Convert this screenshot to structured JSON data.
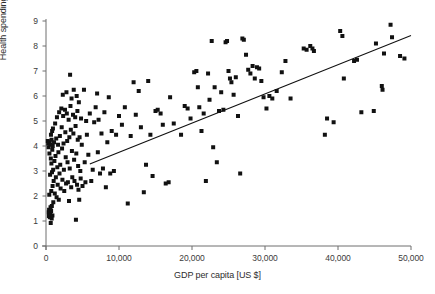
{
  "chart_data": {
    "type": "scatter",
    "title": "",
    "xlabel": "GDP per capita [US $]",
    "ylabel": "Health spending [% GDP]",
    "xlim": [
      0,
      50000
    ],
    "ylim": [
      0,
      9
    ],
    "grid": false,
    "legend": null,
    "xticks": [
      0,
      10000,
      20000,
      30000,
      40000,
      50000
    ],
    "xticklabels": [
      "0",
      "10,000",
      "20,000",
      "30,000",
      "40,000",
      "50,000"
    ],
    "yticks": [
      0,
      1,
      2,
      3,
      4,
      5,
      6,
      7,
      8,
      9
    ],
    "yticklabels": [
      "0",
      "1",
      "2",
      "3",
      "4",
      "5",
      "6",
      "7",
      "8",
      "9"
    ],
    "marker": "square",
    "marker_color": "#111111",
    "marker_size_px": 4,
    "spines": [
      "left",
      "bottom"
    ],
    "trendline": {
      "type": "linear",
      "color": "#111111",
      "x_start": 6000,
      "y_start": 3.28,
      "x_end": 50000,
      "y_end": 8.42
    },
    "points": [
      [
        250,
        4.2
      ],
      [
        300,
        4.1
      ],
      [
        350,
        3.95
      ],
      [
        380,
        1.35
      ],
      [
        400,
        1.2
      ],
      [
        420,
        1.45
      ],
      [
        450,
        2.05
      ],
      [
        470,
        3.7
      ],
      [
        500,
        4.15
      ],
      [
        520,
        1.15
      ],
      [
        540,
        1.3
      ],
      [
        560,
        2.85
      ],
      [
        580,
        4.05
      ],
      [
        600,
        1.25
      ],
      [
        620,
        1.55
      ],
      [
        650,
        0.92
      ],
      [
        660,
        3.5
      ],
      [
        680,
        4.45
      ],
      [
        700,
        1.4
      ],
      [
        720,
        2.2
      ],
      [
        740,
        3.3
      ],
      [
        760,
        4.25
      ],
      [
        780,
        1.1
      ],
      [
        800,
        1.6
      ],
      [
        820,
        2.95
      ],
      [
        840,
        4.6
      ],
      [
        860,
        3.85
      ],
      [
        880,
        1.22
      ],
      [
        900,
        2.4
      ],
      [
        920,
        4.0
      ],
      [
        950,
        4.7
      ],
      [
        980,
        3.05
      ],
      [
        1000,
        1.75
      ],
      [
        1050,
        2.6
      ],
      [
        1100,
        4.15
      ],
      [
        1150,
        3.4
      ],
      [
        1200,
        2.1
      ],
      [
        1250,
        4.9
      ],
      [
        1300,
        3.6
      ],
      [
        1350,
        2.75
      ],
      [
        1400,
        4.3
      ],
      [
        1450,
        1.95
      ],
      [
        1500,
        5.15
      ],
      [
        1550,
        3.15
      ],
      [
        1600,
        2.45
      ],
      [
        1650,
        4.05
      ],
      [
        1700,
        3.75
      ],
      [
        1750,
        1.85
      ],
      [
        1800,
        5.35
      ],
      [
        1850,
        2.9
      ],
      [
        1900,
        4.4
      ],
      [
        1950,
        3.25
      ],
      [
        2000,
        2.3
      ],
      [
        2100,
        5.5
      ],
      [
        2150,
        4.75
      ],
      [
        2200,
        3.9
      ],
      [
        2250,
        2.65
      ],
      [
        2300,
        6.05
      ],
      [
        2350,
        5.2
      ],
      [
        2400,
        4.1
      ],
      [
        2450,
        3.05
      ],
      [
        2500,
        2.2
      ],
      [
        2600,
        5.45
      ],
      [
        2650,
        4.55
      ],
      [
        2700,
        3.55
      ],
      [
        2750,
        2.5
      ],
      [
        2800,
        6.15
      ],
      [
        2850,
        5.3
      ],
      [
        2900,
        4.2
      ],
      [
        2950,
        3.35
      ],
      [
        3000,
        2.55
      ],
      [
        3100,
        5.05
      ],
      [
        3150,
        1.8
      ],
      [
        3200,
        4.35
      ],
      [
        3250,
        3.1
      ],
      [
        3300,
        6.85
      ],
      [
        3350,
        5.6
      ],
      [
        3400,
        4.65
      ],
      [
        3450,
        2.35
      ],
      [
        3500,
        5.9
      ],
      [
        3550,
        3.8
      ],
      [
        3600,
        2.75
      ],
      [
        3700,
        5.25
      ],
      [
        3750,
        4.5
      ],
      [
        3800,
        6.25
      ],
      [
        3850,
        3.45
      ],
      [
        3900,
        2.6
      ],
      [
        4000,
        5.15
      ],
      [
        4050,
        4.8
      ],
      [
        4100,
        1.05
      ],
      [
        4150,
        3.7
      ],
      [
        4200,
        6.0
      ],
      [
        4250,
        2.45
      ],
      [
        4300,
        5.4
      ],
      [
        4350,
        4.25
      ],
      [
        4400,
        3.2
      ],
      [
        4450,
        2.25
      ],
      [
        4500,
        5.75
      ],
      [
        4550,
        1.85
      ],
      [
        4600,
        4.35
      ],
      [
        4700,
        3.0
      ],
      [
        4750,
        2.7
      ],
      [
        4800,
        5.1
      ],
      [
        4900,
        4.05
      ],
      [
        5000,
        2.4
      ],
      [
        5200,
        6.25
      ],
      [
        5300,
        3.35
      ],
      [
        5400,
        2.55
      ],
      [
        5500,
        5.0
      ],
      [
        5600,
        4.45
      ],
      [
        5800,
        3.65
      ],
      [
        6000,
        5.3
      ],
      [
        6200,
        2.6
      ],
      [
        6400,
        3.05
      ],
      [
        6600,
        4.95
      ],
      [
        6800,
        5.55
      ],
      [
        7000,
        6.1
      ],
      [
        7100,
        3.75
      ],
      [
        7200,
        5.05
      ],
      [
        7400,
        2.9
      ],
      [
        7600,
        4.5
      ],
      [
        7800,
        3.1
      ],
      [
        8000,
        5.35
      ],
      [
        8200,
        2.35
      ],
      [
        8400,
        4.15
      ],
      [
        8600,
        5.95
      ],
      [
        8800,
        2.9
      ],
      [
        9000,
        4.6
      ],
      [
        9300,
        3.0
      ],
      [
        9600,
        4.45
      ],
      [
        10000,
        5.2
      ],
      [
        10400,
        4.85
      ],
      [
        10800,
        5.55
      ],
      [
        11200,
        1.7
      ],
      [
        11600,
        4.4
      ],
      [
        12000,
        6.55
      ],
      [
        12300,
        5.25
      ],
      [
        12700,
        6.2
      ],
      [
        13000,
        4.75
      ],
      [
        13400,
        2.15
      ],
      [
        13700,
        3.25
      ],
      [
        14000,
        6.6
      ],
      [
        14300,
        4.45
      ],
      [
        14600,
        2.8
      ],
      [
        15000,
        5.4
      ],
      [
        15300,
        5.45
      ],
      [
        15700,
        5.3
      ],
      [
        16000,
        4.85
      ],
      [
        16400,
        2.5
      ],
      [
        16800,
        2.55
      ],
      [
        17000,
        5.95
      ],
      [
        17500,
        4.9
      ],
      [
        18500,
        4.45
      ],
      [
        19000,
        5.6
      ],
      [
        19400,
        5.5
      ],
      [
        19800,
        5.1
      ],
      [
        20300,
        6.95
      ],
      [
        20600,
        7.0
      ],
      [
        20800,
        6.35
      ],
      [
        21000,
        5.55
      ],
      [
        21300,
        4.6
      ],
      [
        21600,
        5.3
      ],
      [
        21900,
        2.6
      ],
      [
        22200,
        6.9
      ],
      [
        22400,
        5.85
      ],
      [
        22700,
        8.2
      ],
      [
        22900,
        3.95
      ],
      [
        23100,
        6.35
      ],
      [
        23400,
        3.35
      ],
      [
        23700,
        5.4
      ],
      [
        24000,
        6.15
      ],
      [
        24300,
        5.45
      ],
      [
        24600,
        8.15
      ],
      [
        24800,
        8.2
      ],
      [
        25000,
        7.0
      ],
      [
        25200,
        6.7
      ],
      [
        25400,
        6.55
      ],
      [
        25700,
        6.05
      ],
      [
        26000,
        6.75
      ],
      [
        26300,
        5.2
      ],
      [
        26600,
        2.9
      ],
      [
        26900,
        8.3
      ],
      [
        27100,
        8.25
      ],
      [
        27400,
        7.65
      ],
      [
        27700,
        7.05
      ],
      [
        28000,
        6.9
      ],
      [
        28300,
        7.2
      ],
      [
        28600,
        6.7
      ],
      [
        28900,
        7.15
      ],
      [
        29200,
        7.1
      ],
      [
        29500,
        6.6
      ],
      [
        29800,
        5.95
      ],
      [
        30200,
        5.5
      ],
      [
        30600,
        6.0
      ],
      [
        31000,
        5.9
      ],
      [
        31600,
        6.2
      ],
      [
        32300,
        6.95
      ],
      [
        32800,
        7.4
      ],
      [
        33500,
        5.9
      ],
      [
        35300,
        7.9
      ],
      [
        35700,
        7.85
      ],
      [
        36200,
        8.0
      ],
      [
        36500,
        7.9
      ],
      [
        36700,
        7.8
      ],
      [
        38200,
        4.45
      ],
      [
        38500,
        5.1
      ],
      [
        39400,
        4.95
      ],
      [
        40300,
        8.6
      ],
      [
        40600,
        8.4
      ],
      [
        40800,
        6.7
      ],
      [
        42200,
        7.4
      ],
      [
        42600,
        7.45
      ],
      [
        43200,
        5.35
      ],
      [
        44900,
        5.4
      ],
      [
        45200,
        8.1
      ],
      [
        46000,
        6.4
      ],
      [
        46100,
        6.25
      ],
      [
        46300,
        7.7
      ],
      [
        47200,
        8.85
      ],
      [
        47400,
        8.35
      ],
      [
        48500,
        7.6
      ],
      [
        49100,
        7.5
      ]
    ]
  }
}
